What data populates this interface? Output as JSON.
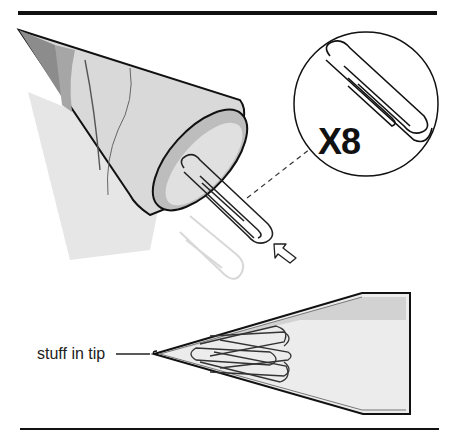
{
  "figure": {
    "type": "instructional-illustration",
    "callout": {
      "quantity_label": "X8",
      "item_icon": "paperclip-icon"
    },
    "annotations": {
      "tip_label": "stuff in tip"
    },
    "colors": {
      "line": "#111111",
      "cone_dark": "#8a8a8a",
      "cone_mid": "#b9b9b9",
      "cone_light": "#dcdcdc",
      "shadow": "#e4e4e4",
      "background": "#ffffff"
    }
  }
}
